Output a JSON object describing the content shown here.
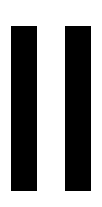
{
  "canvas": {
    "width": 102,
    "height": 207,
    "background_color": "#ffffff"
  },
  "chart_data": {
    "type": "bar",
    "title": "",
    "subtitle": "",
    "xlabel": "",
    "ylabel": "",
    "orientation": "vertical",
    "grid": false,
    "legend": null,
    "legend_position": "none",
    "axis_visible": false,
    "tick_labels_visible": false,
    "data_labels_visible": false,
    "categories": [
      "",
      ""
    ],
    "values": [
      165,
      165
    ],
    "ylim": [
      0,
      165
    ],
    "bar_color": "#000000",
    "bar_width_px": 26,
    "bar_gap_px": 27,
    "series": [
      {
        "name": "",
        "color": "#000000",
        "values": [
          165,
          165
        ]
      }
    ],
    "bars": [
      {
        "name": "bar-1",
        "x": 11,
        "y": 26,
        "width": 26,
        "height": 165,
        "color": "#000000",
        "value": 165,
        "label": ""
      },
      {
        "name": "bar-2",
        "x": 65,
        "y": 26,
        "width": 26,
        "height": 165,
        "color": "#000000",
        "value": 165,
        "label": ""
      }
    ]
  }
}
